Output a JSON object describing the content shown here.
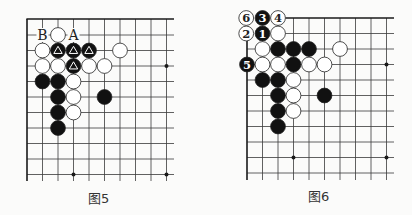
{
  "figures": [
    {
      "id": "fig5",
      "caption": "图5",
      "caption_pos": [
        88,
        188
      ],
      "grid": {
        "x": [
          27,
          42.5,
          58,
          73.5,
          89,
          104.5,
          120,
          135.5,
          151,
          166.5
        ],
        "y": [
          19,
          35,
          50.5,
          66,
          81.5,
          97,
          112.5,
          128,
          143.5,
          159,
          174.5
        ],
        "right_extend": 174,
        "bottom_extend": 181,
        "top_edge": true,
        "left_edge": true,
        "left_edge_start_row": 0
      },
      "star_points": [
        [
          9,
          3
        ],
        [
          3,
          10
        ],
        [
          9,
          10
        ]
      ],
      "stones": [
        {
          "c": "w",
          "col": 2,
          "row": 1
        },
        {
          "c": "w",
          "col": 1,
          "row": 2
        },
        {
          "c": "b",
          "col": 2,
          "row": 2,
          "mark": "triangle"
        },
        {
          "c": "b",
          "col": 3,
          "row": 2,
          "mark": "triangle"
        },
        {
          "c": "b",
          "col": 4,
          "row": 2,
          "mark": "triangle"
        },
        {
          "c": "w",
          "col": 6,
          "row": 2
        },
        {
          "c": "w",
          "col": 1,
          "row": 3
        },
        {
          "c": "w",
          "col": 2,
          "row": 3
        },
        {
          "c": "b",
          "col": 3,
          "row": 3,
          "mark": "triangle"
        },
        {
          "c": "w",
          "col": 4,
          "row": 3
        },
        {
          "c": "w",
          "col": 5,
          "row": 3
        },
        {
          "c": "b",
          "col": 1,
          "row": 4
        },
        {
          "c": "b",
          "col": 2,
          "row": 4
        },
        {
          "c": "w",
          "col": 3,
          "row": 4
        },
        {
          "c": "b",
          "col": 2,
          "row": 5
        },
        {
          "c": "w",
          "col": 3,
          "row": 5
        },
        {
          "c": "b",
          "col": 5,
          "row": 5
        },
        {
          "c": "b",
          "col": 2,
          "row": 6
        },
        {
          "c": "w",
          "col": 3,
          "row": 6
        },
        {
          "c": "b",
          "col": 2,
          "row": 7
        }
      ],
      "labels": [
        {
          "text": "B",
          "col": 1,
          "row": 1
        },
        {
          "text": "A",
          "col": 3,
          "row": 1
        }
      ]
    },
    {
      "id": "fig6",
      "caption": "图6",
      "caption_pos": [
        308,
        186
      ],
      "grid": {
        "x": [
          247,
          262.5,
          278,
          293.5,
          309,
          324.5,
          340,
          355.5,
          371,
          386.5
        ],
        "y": [
          18,
          33.5,
          49,
          64.5,
          80,
          95.5,
          111,
          126.5,
          142,
          157.5,
          173
        ],
        "right_extend": 394,
        "bottom_extend": 180,
        "top_edge": true,
        "top_edge_start_col": 2,
        "left_edge": true,
        "left_edge_start_row": 2
      },
      "star_points": [
        [
          9,
          3
        ],
        [
          3,
          9
        ],
        [
          9,
          9
        ]
      ],
      "stones": [
        {
          "c": "w",
          "col": -0.05,
          "row": 0,
          "num": "6"
        },
        {
          "c": "b",
          "col": 1,
          "row": 0,
          "num": "3"
        },
        {
          "c": "w",
          "col": 2,
          "row": 0,
          "num": "4"
        },
        {
          "c": "w",
          "col": -0.05,
          "row": 1,
          "num": "2"
        },
        {
          "c": "b",
          "col": 1,
          "row": 1,
          "num": "1"
        },
        {
          "c": "w",
          "col": 2,
          "row": 1
        },
        {
          "c": "w",
          "col": 1,
          "row": 2
        },
        {
          "c": "b",
          "col": 2,
          "row": 2
        },
        {
          "c": "b",
          "col": 3,
          "row": 2
        },
        {
          "c": "b",
          "col": 4,
          "row": 2
        },
        {
          "c": "w",
          "col": 6,
          "row": 2
        },
        {
          "c": "b",
          "col": 0,
          "row": 3,
          "num": "5"
        },
        {
          "c": "w",
          "col": 1,
          "row": 3
        },
        {
          "c": "w",
          "col": 2,
          "row": 3
        },
        {
          "c": "b",
          "col": 3,
          "row": 3
        },
        {
          "c": "w",
          "col": 4,
          "row": 3
        },
        {
          "c": "w",
          "col": 5,
          "row": 3
        },
        {
          "c": "b",
          "col": 1,
          "row": 4
        },
        {
          "c": "b",
          "col": 2,
          "row": 4
        },
        {
          "c": "w",
          "col": 3,
          "row": 4
        },
        {
          "c": "b",
          "col": 2,
          "row": 5
        },
        {
          "c": "w",
          "col": 3,
          "row": 5
        },
        {
          "c": "b",
          "col": 5,
          "row": 5
        },
        {
          "c": "b",
          "col": 2,
          "row": 6
        },
        {
          "c": "w",
          "col": 3,
          "row": 6
        },
        {
          "c": "b",
          "col": 2,
          "row": 7
        }
      ],
      "labels": []
    }
  ],
  "colors": {
    "line": "#3a3a3a",
    "edge": "#1a1a1a",
    "black_stone": "#111111",
    "white_stone": "#ffffff",
    "stone_stroke": "#222222",
    "background": "#fbfbfa"
  }
}
